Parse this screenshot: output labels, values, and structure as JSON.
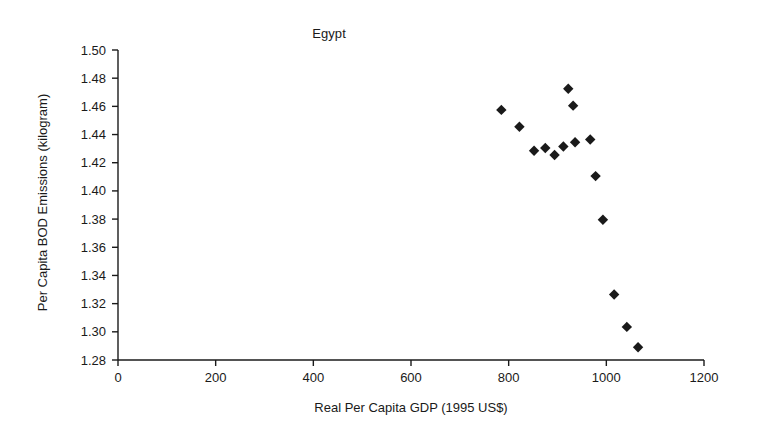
{
  "chart_data": {
    "type": "scatter",
    "title": "Egypt",
    "xlabel": "Real Per Capita GDP (1995 US$)",
    "ylabel": "Per Capita BOD Emissions (kilogram)",
    "xlim": [
      0,
      1200
    ],
    "ylim": [
      1.28,
      1.5
    ],
    "xticks": [
      0,
      200,
      400,
      600,
      800,
      1000,
      1200
    ],
    "yticks": [
      1.28,
      1.3,
      1.32,
      1.34,
      1.36,
      1.38,
      1.4,
      1.42,
      1.44,
      1.46,
      1.48,
      1.5
    ],
    "xtick_labels": [
      "0",
      "200",
      "400",
      "600",
      "800",
      "1000",
      "1200"
    ],
    "ytick_labels": [
      "1.28",
      "1.30",
      "1.32",
      "1.34",
      "1.36",
      "1.38",
      "1.40",
      "1.42",
      "1.44",
      "1.46",
      "1.48",
      "1.50"
    ],
    "grid": false,
    "legend": "none",
    "marker": "diamond",
    "marker_color": "#1a1a1a",
    "series": [
      {
        "name": "Egypt",
        "points": [
          {
            "x": 785,
            "y": 1.4575
          },
          {
            "x": 822,
            "y": 1.4455
          },
          {
            "x": 852,
            "y": 1.4285
          },
          {
            "x": 875,
            "y": 1.4305
          },
          {
            "x": 894,
            "y": 1.4255
          },
          {
            "x": 912,
            "y": 1.4315
          },
          {
            "x": 922,
            "y": 1.4725
          },
          {
            "x": 932,
            "y": 1.4605
          },
          {
            "x": 936,
            "y": 1.4345
          },
          {
            "x": 967,
            "y": 1.4365
          },
          {
            "x": 978,
            "y": 1.4105
          },
          {
            "x": 993,
            "y": 1.3795
          },
          {
            "x": 1016,
            "y": 1.3265
          },
          {
            "x": 1042,
            "y": 1.3035
          },
          {
            "x": 1065,
            "y": 1.289
          }
        ]
      }
    ]
  }
}
